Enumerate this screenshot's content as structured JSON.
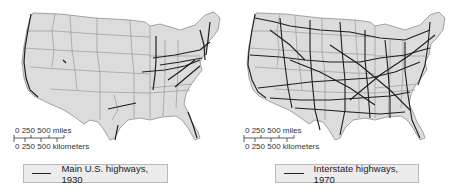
{
  "panels": [
    {
      "id": "map-1930",
      "legend": {
        "label": "Main U.S. highways, 1930",
        "line_color": "#222222"
      },
      "scale": {
        "miles_label": "0   250   500 miles",
        "km_label": "0  250 500 kilometers"
      }
    },
    {
      "id": "map-1970",
      "legend": {
        "label": "Interstate highways, 1970",
        "line_color": "#222222"
      },
      "scale": {
        "miles_label": "0   250   500 miles",
        "km_label": "0  250 500 kilometers"
      }
    }
  ],
  "colors": {
    "land": "#dcdcdc",
    "state_border": "#8e8e8e",
    "highway": "#1e1e1e",
    "background": "#ffffff"
  }
}
